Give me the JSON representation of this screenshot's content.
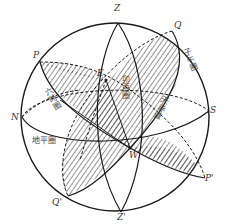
{
  "diagram": {
    "points": {
      "Z": "Z",
      "Z_prime": "Z'",
      "Q": "Q",
      "Q_prime": "Q'",
      "P": "P",
      "P_prime": "P'",
      "N": "N",
      "S": "S",
      "E": "E",
      "W": "W"
    },
    "circles": {
      "meridian": "子午圈",
      "six_hour_circle": "六時圈",
      "prime_vertical": "卯酉圈",
      "celestial_equator": "天赤道",
      "horizon": "地平圈"
    },
    "colors": {
      "stroke": "#1a1a1a",
      "hatch": "#2a2a2a",
      "background": "#ffffff"
    }
  }
}
